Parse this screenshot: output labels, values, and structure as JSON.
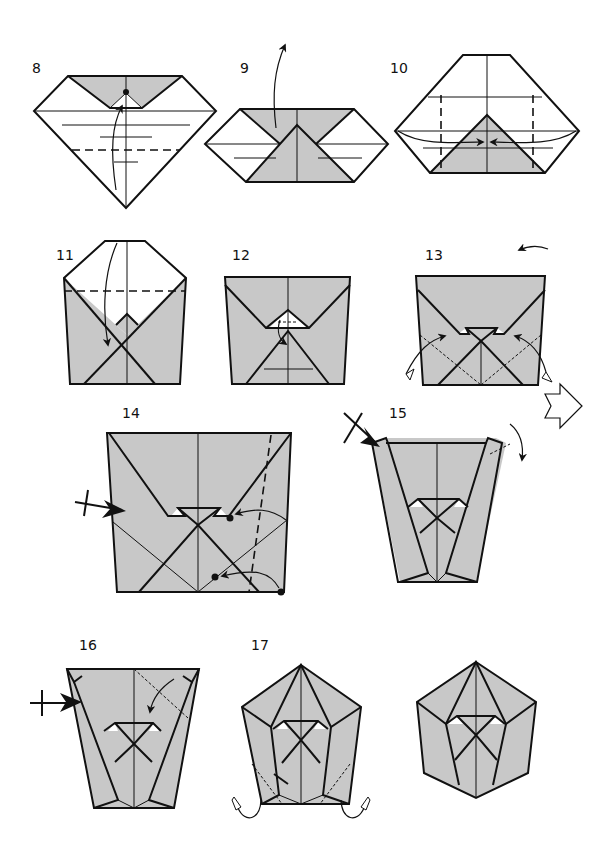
{
  "diagram": {
    "colors": {
      "paper_colored": "#c8c8c8",
      "paper_white": "#ffffff",
      "line": "#111111"
    },
    "steps": [
      {
        "id": "8",
        "label": "8",
        "actions": [
          "valley-fold bottom point up to the dot"
        ]
      },
      {
        "id": "9",
        "label": "9",
        "actions": [
          "unfold upward"
        ]
      },
      {
        "id": "10",
        "label": "10",
        "actions": [
          "valley-fold both sides to center"
        ]
      },
      {
        "id": "11",
        "label": "11",
        "actions": [
          "valley-fold top down"
        ]
      },
      {
        "id": "12",
        "label": "12",
        "actions": [
          "fold small flap down"
        ]
      },
      {
        "id": "13",
        "label": "13",
        "actions": [
          "reverse-fold both sides",
          "turn over"
        ]
      },
      {
        "id": "14",
        "label": "14",
        "actions": [
          "squash-fold",
          "bring dot to dot",
          "valley-fold"
        ]
      },
      {
        "id": "15",
        "label": "15",
        "actions": [
          "squash",
          "fold corner behind"
        ]
      },
      {
        "id": "16",
        "label": "16",
        "actions": [
          "squash",
          "fold corner down"
        ]
      },
      {
        "id": "17",
        "label": "17",
        "actions": [
          "fold bottom corners behind"
        ]
      },
      {
        "id": "final",
        "label": "",
        "actions": []
      }
    ],
    "symbols": {
      "turn_over": "turn-over-arrow",
      "push": "push-arrow",
      "repeat": "repeat-arrow"
    }
  }
}
